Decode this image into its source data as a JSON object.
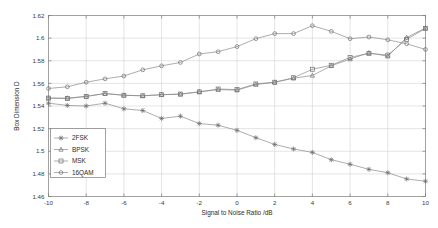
{
  "chart_data": {
    "type": "line",
    "title": "",
    "xlabel": "Signal to Noise Ratio /dB",
    "ylabel": "Box Dimension D",
    "xlim": [
      -10,
      10
    ],
    "ylim": [
      1.46,
      1.62
    ],
    "grid": true,
    "legend_position": "lower-left-inside",
    "xticks": [
      "-10",
      "-8",
      "-6",
      "-4",
      "-2",
      "0",
      "2",
      "4",
      "6",
      "8",
      "10"
    ],
    "xtick_values": [
      -10,
      -8,
      -6,
      -4,
      -2,
      0,
      2,
      4,
      6,
      8,
      10
    ],
    "yticks": [
      "1.46",
      "1.48",
      "1.5",
      "1.52",
      "1.54",
      "1.56",
      "1.58",
      "1.6",
      "1.62"
    ],
    "ytick_values": [
      1.46,
      1.48,
      1.5,
      1.52,
      1.54,
      1.56,
      1.58,
      1.6,
      1.62
    ],
    "x": [
      -10,
      -9,
      -8,
      -7,
      -6,
      -5,
      -4,
      -3,
      -2,
      -1,
      0,
      1,
      2,
      3,
      4,
      5,
      6,
      7,
      8,
      9,
      10
    ],
    "series": [
      {
        "name": "2FSK",
        "marker": "star",
        "color": "#8a8a8a",
        "values": [
          1.5425,
          1.5405,
          1.54,
          1.5425,
          1.5375,
          1.536,
          1.529,
          1.531,
          1.5245,
          1.523,
          1.5185,
          1.512,
          1.506,
          1.502,
          1.499,
          1.4925,
          1.4885,
          1.484,
          1.481,
          1.4755,
          1.4735
        ]
      },
      {
        "name": "BPSK",
        "marker": "triangle",
        "color": "#8a8a8a",
        "values": [
          1.547,
          1.547,
          1.5485,
          1.551,
          1.5495,
          1.549,
          1.55,
          1.5505,
          1.5525,
          1.5545,
          1.554,
          1.559,
          1.561,
          1.5645,
          1.567,
          1.5755,
          1.5815,
          1.587,
          1.584,
          1.6005,
          1.609
        ]
      },
      {
        "name": "MSK",
        "marker": "square",
        "color": "#8a8a8a",
        "values": [
          1.547,
          1.5465,
          1.5485,
          1.551,
          1.5495,
          1.549,
          1.55,
          1.5505,
          1.5525,
          1.555,
          1.5545,
          1.5595,
          1.561,
          1.565,
          1.5725,
          1.576,
          1.583,
          1.5865,
          1.585,
          1.599,
          1.6085
        ]
      },
      {
        "name": "16QAM",
        "marker": "circle",
        "color": "#8a8a8a",
        "values": [
          1.5555,
          1.557,
          1.561,
          1.564,
          1.5665,
          1.572,
          1.5755,
          1.5785,
          1.586,
          1.588,
          1.5925,
          1.5995,
          1.604,
          1.604,
          1.611,
          1.606,
          1.5995,
          1.601,
          1.5985,
          1.595,
          1.59
        ]
      }
    ]
  }
}
